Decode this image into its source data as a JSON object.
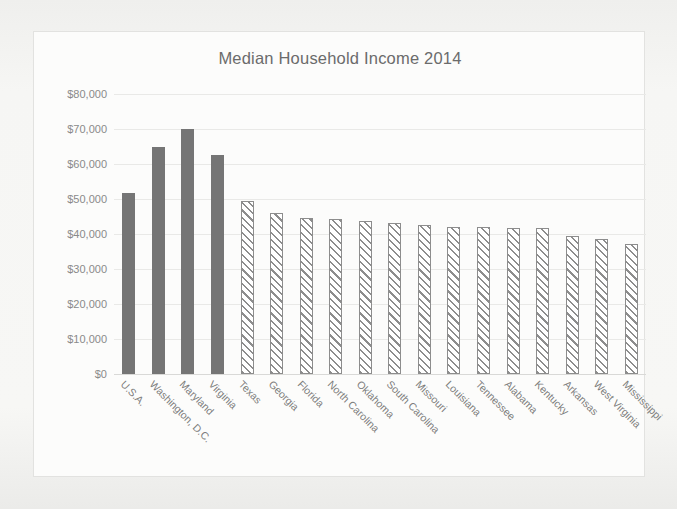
{
  "chart_data": {
    "type": "bar",
    "title": "Median Household Income 2014",
    "xlabel": "",
    "ylabel": "",
    "ylim": [
      0,
      80000
    ],
    "grid": true,
    "legend": "none",
    "ytick_labels": [
      "$80,000",
      "$70,000",
      "$60,000",
      "$50,000",
      "$40,000",
      "$30,000",
      "$20,000",
      "$10,000",
      "$0"
    ],
    "ytick_values": [
      80000,
      70000,
      60000,
      50000,
      40000,
      30000,
      20000,
      10000,
      0
    ],
    "categories": [
      "U.S.A.",
      "Washington, D.C.",
      "Maryland",
      "Virginia",
      "Texas",
      "Georgia",
      "Florida",
      "North Carolina",
      "Oklahoma",
      "South Carolina",
      "Missouri",
      "Louisiana",
      "Tennessee",
      "Alabama",
      "Kentucky",
      "Arkansas",
      "West Virginia",
      "Mississippi"
    ],
    "values": [
      51800,
      65000,
      70000,
      62700,
      49500,
      46000,
      44500,
      44400,
      43700,
      43100,
      42600,
      42000,
      42000,
      41800,
      41800,
      39300,
      38700,
      37200
    ],
    "series_styles": [
      "solid",
      "solid",
      "solid",
      "solid",
      "hatched",
      "hatched",
      "hatched",
      "hatched",
      "hatched",
      "hatched",
      "hatched",
      "hatched",
      "hatched",
      "hatched",
      "hatched",
      "hatched",
      "hatched",
      "hatched"
    ],
    "colors": {
      "solid_bar": "#757575",
      "hatch_stroke": "#8d8d8d",
      "hatch_fill": "#ffffff",
      "gridline": "#e9e9e7",
      "title_text": "#6b6b6b",
      "tick_text": "#8a8a8a",
      "plot_background": "#fcfcfb",
      "frame_border": "#e2e2e0"
    }
  }
}
